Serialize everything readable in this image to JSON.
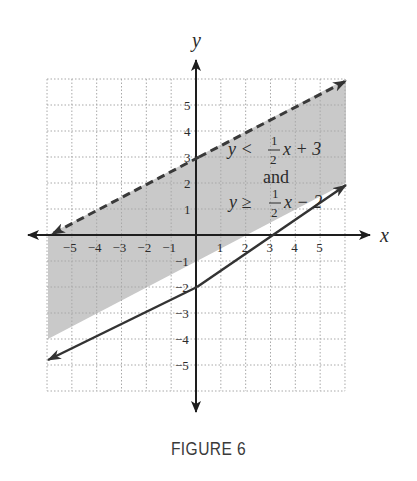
{
  "figure": {
    "caption": "FIGURE 6",
    "axis_labels": {
      "x": "x",
      "y": "y"
    },
    "colors": {
      "shade": "#c9c9c9",
      "grid": "#a8a8a8",
      "axis": "#2b2b2b",
      "line": "#3a3a3a"
    },
    "annotation": {
      "line1_lhs": "y <",
      "line1_frac_num": "1",
      "line1_frac_den": "2",
      "line1_rhs": "x + 3",
      "connector": "and",
      "line2_lhs": "y ≥",
      "line2_frac_num": "1",
      "line2_frac_den": "2",
      "line2_rhs": "x − 2"
    }
  },
  "chart_data": {
    "type": "line",
    "title": "",
    "caption": "FIGURE 6",
    "xlabel": "x",
    "ylabel": "y",
    "xlim": [
      -6,
      6
    ],
    "ylim": [
      -6,
      6
    ],
    "grid": true,
    "grid_style": "dotted",
    "x_ticks": [
      -5,
      -4,
      -3,
      -2,
      -1,
      1,
      2,
      3,
      4,
      5
    ],
    "y_ticks": [
      -5,
      -4,
      -3,
      -2,
      -1,
      1,
      2,
      3,
      4,
      5
    ],
    "series": [
      {
        "name": "y < 1/2 x + 3",
        "style": "dashed",
        "slope": 0.5,
        "intercept": 3,
        "x": [
          -6,
          6
        ],
        "y": [
          0,
          6
        ],
        "arrows": "both"
      },
      {
        "name": "y ≥ 1/2 x − 2",
        "style": "solid",
        "slope": 0.5,
        "intercept": -2,
        "x": [
          -6,
          6
        ],
        "y": [
          -5,
          1
        ],
        "arrows": "both"
      }
    ],
    "shaded_region": "between lines: 1/2 x − 2 ≤ y < 1/2 x + 3",
    "annotations": [
      "y < 1/2 x + 3",
      "and",
      "y ≥ 1/2 x − 2"
    ]
  }
}
